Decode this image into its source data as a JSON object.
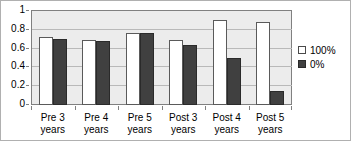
{
  "chart_data": {
    "type": "bar",
    "title": "",
    "subtitle": "",
    "xlabel": "",
    "ylabel": "",
    "ylim": [
      0,
      1
    ],
    "yticks": [
      "0",
      "0.2",
      "0.4",
      "0.6",
      "0.8",
      "1"
    ],
    "ytick_values": [
      0,
      0.2,
      0.4,
      0.6,
      0.8,
      1
    ],
    "grid": "horizontal",
    "legend_position": "right",
    "categories": [
      "Pre 3 years",
      "Pre 4 years",
      "Pre 5 years",
      "Post 3 years",
      "Post 4 years",
      "Post 5 years"
    ],
    "category_lines": [
      [
        "Pre 3",
        "years"
      ],
      [
        "Pre 4",
        "years"
      ],
      [
        "Pre 5",
        "years"
      ],
      [
        "Post 3",
        "years"
      ],
      [
        "Post 4",
        "years"
      ],
      [
        "Post 5",
        "years"
      ]
    ],
    "series": [
      {
        "name": "100%",
        "color": "#ffffff",
        "values": [
          0.72,
          0.69,
          0.77,
          0.69,
          0.9,
          0.88
        ]
      },
      {
        "name": "0%",
        "color": "#404040",
        "values": [
          0.7,
          0.68,
          0.77,
          0.64,
          0.5,
          0.15
        ]
      }
    ]
  },
  "legend": {
    "items": [
      {
        "label": "100%",
        "swatch": "white-square-swatch"
      },
      {
        "label": "0%",
        "swatch": "dark-square-swatch"
      }
    ]
  },
  "colors": {
    "plot_background": "#ececec",
    "gridline": "#b9b9b9",
    "axis": "#808080",
    "series_100": "#ffffff",
    "series_0": "#404040",
    "frame": "#b0b0b0"
  }
}
